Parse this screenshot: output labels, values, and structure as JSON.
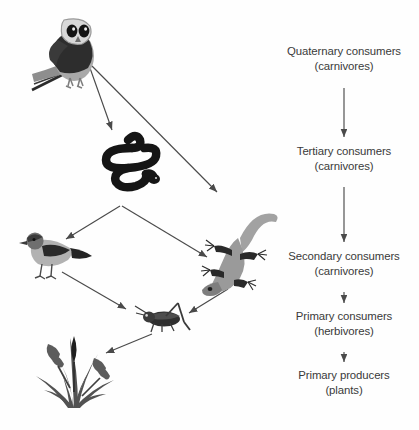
{
  "diagram": {
    "background_color": "#fefefe",
    "text_color": "#3a3a3a",
    "arrow_color": "#4a4a4a",
    "levels": [
      {
        "id": "quaternary",
        "label": "Quaternary consumers",
        "sub": "(carnivores)"
      },
      {
        "id": "tertiary",
        "label": "Tertiary consumers",
        "sub": "(carnivores)"
      },
      {
        "id": "secondary",
        "label": "Secondary consumers",
        "sub": "(carnivores)"
      },
      {
        "id": "primary_consumers",
        "label": "Primary consumers",
        "sub": "(herbivores)"
      },
      {
        "id": "primary_producers",
        "label": "Primary producers",
        "sub": "(plants)"
      }
    ],
    "organisms": [
      {
        "id": "owl",
        "name": "owl",
        "icon": "owl-illustration",
        "level": "quaternary"
      },
      {
        "id": "snake",
        "name": "snake",
        "icon": "snake-illustration",
        "level": "tertiary"
      },
      {
        "id": "bird",
        "name": "bird",
        "icon": "bird-illustration",
        "level": "secondary"
      },
      {
        "id": "lizard",
        "name": "lizard",
        "icon": "lizard-illustration",
        "level": "secondary"
      },
      {
        "id": "grasshopper",
        "name": "grasshopper",
        "icon": "grasshopper-illustration",
        "level": "primary_consumers"
      },
      {
        "id": "grass",
        "name": "grass",
        "icon": "grass-illustration",
        "level": "primary_producers"
      }
    ],
    "food_web_arrows": [
      {
        "from": "owl",
        "to": "snake"
      },
      {
        "from": "owl",
        "to": "lizard"
      },
      {
        "from": "snake",
        "to": "bird"
      },
      {
        "from": "snake",
        "to": "lizard"
      },
      {
        "from": "bird",
        "to": "grasshopper"
      },
      {
        "from": "lizard",
        "to": "grasshopper"
      },
      {
        "from": "grasshopper",
        "to": "grass"
      }
    ],
    "level_arrows": [
      {
        "from": "quaternary",
        "to": "tertiary"
      },
      {
        "from": "tertiary",
        "to": "secondary"
      },
      {
        "from": "secondary",
        "to": "primary_consumers"
      },
      {
        "from": "primary_consumers",
        "to": "primary_producers"
      }
    ]
  }
}
